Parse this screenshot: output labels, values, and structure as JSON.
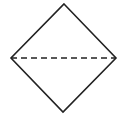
{
  "diagram": {
    "shape": "diamond",
    "stroke_color": "#222222",
    "background_color": "#ffffff",
    "stroke_width": 1.6,
    "vertices": {
      "top": [
        64,
        4
      ],
      "right": [
        116,
        58
      ],
      "bottom": [
        63,
        112
      ],
      "left": [
        11,
        58
      ]
    },
    "diagonal": {
      "style": "dashed",
      "from": [
        11,
        58
      ],
      "to": [
        116,
        58
      ],
      "dash_pattern": "6 4"
    }
  }
}
